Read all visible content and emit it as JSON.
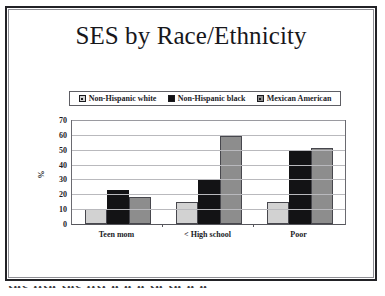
{
  "slide": {
    "title": "SES by Race/Ethnicity"
  },
  "caption": {
    "clipped_text": "the llth the lltl h h h th th h h"
  },
  "chart_data": {
    "type": "bar",
    "title": "SES by Race/Ethnicity",
    "xlabel": "",
    "ylabel": "%",
    "ylim": [
      0,
      70
    ],
    "yticks": [
      70,
      60,
      50,
      40,
      30,
      20,
      10,
      0
    ],
    "grid": true,
    "legend_position": "top",
    "categories": [
      "Teen mom",
      "< High school",
      "Poor"
    ],
    "series": [
      {
        "name": "Non-Hispanic white",
        "color": "#d2d2d2",
        "values": [
          10,
          15,
          15
        ]
      },
      {
        "name": "Non-Hispanic black",
        "color": "#131315",
        "values": [
          23,
          30,
          49
        ]
      },
      {
        "name": "Mexican American",
        "color": "#8d8d8d",
        "values": [
          18.5,
          59,
          51
        ]
      }
    ]
  }
}
